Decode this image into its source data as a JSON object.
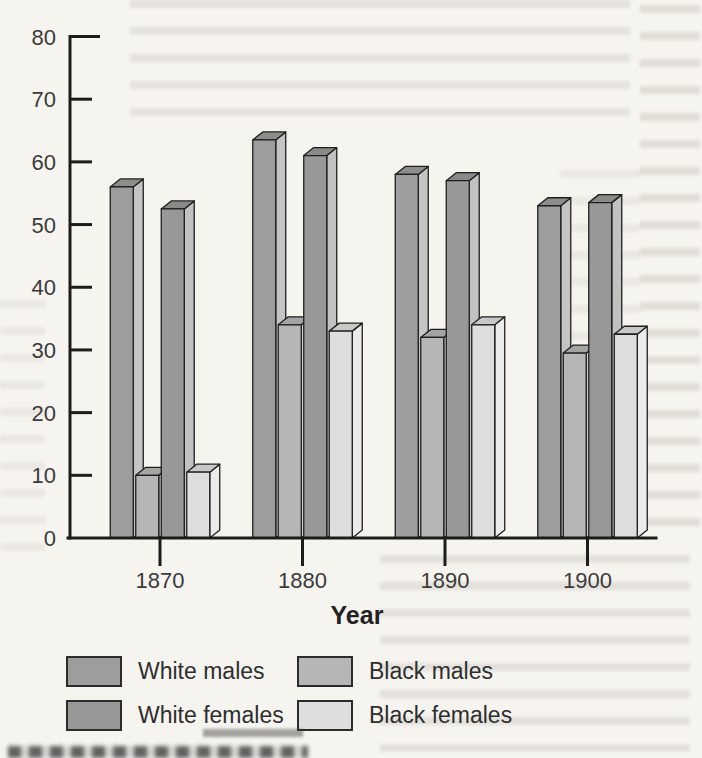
{
  "chart_data": {
    "type": "bar",
    "bar_style": "3d",
    "title": "",
    "xlabel": "Year",
    "ylabel": "",
    "categories": [
      "1870",
      "1880",
      "1890",
      "1900"
    ],
    "series": [
      {
        "name": "White males",
        "values": [
          56,
          63.5,
          58,
          53
        ],
        "color": "#9d9d9d"
      },
      {
        "name": "Black males",
        "values": [
          10,
          34,
          32,
          29.5
        ],
        "color": "#b6b6b6"
      },
      {
        "name": "White females",
        "values": [
          52.5,
          61,
          57,
          53.5
        ],
        "color": "#989898"
      },
      {
        "name": "Black females",
        "values": [
          10.5,
          33,
          34,
          32.5
        ],
        "color": "#dedede"
      }
    ],
    "ylim": [
      0,
      80
    ],
    "yticks": [
      0,
      10,
      20,
      30,
      40,
      50,
      60,
      70,
      80
    ],
    "grid": false,
    "legend_position": "bottom"
  },
  "axis": {
    "y_tick_labels": [
      "0",
      "10",
      "20",
      "30",
      "40",
      "50",
      "60",
      "70",
      "80"
    ],
    "x_tick_labels": [
      "1870",
      "1880",
      "1890",
      "1900"
    ],
    "x_axis_title": "Year"
  },
  "legend": {
    "items": [
      {
        "label": "White males",
        "color": "#9d9d9d"
      },
      {
        "label": "Black males",
        "color": "#b6b6b6"
      },
      {
        "label": "White females",
        "color": "#989898"
      },
      {
        "label": "Black females",
        "color": "#dedede"
      }
    ]
  }
}
